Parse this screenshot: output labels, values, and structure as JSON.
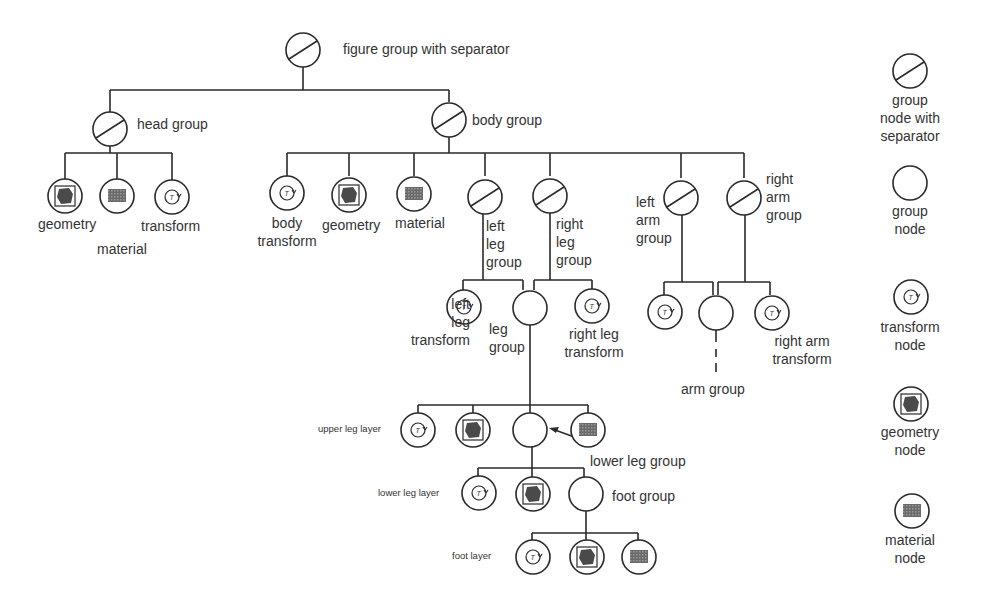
{
  "title": "figure group with separator",
  "nodes": {
    "figure": "figure group with separator",
    "head_group": "head group",
    "head_geometry": "geometry",
    "head_material": "material",
    "head_transform": "transform",
    "body_group": "body group",
    "body_transform": "body\ntransform",
    "body_geometry": "geometry",
    "body_material": "material",
    "left_leg_group": "left\nleg\ngroup",
    "right_leg_group": "right\nleg\ngroup",
    "left_arm_group": "left\narm\ngroup",
    "right_arm_group": "right\narm\ngroup",
    "left_leg_transform": "left\nleg\ntransform",
    "leg_group": "leg\ngroup",
    "right_leg_transform": "right leg\ntransform",
    "arm_group": "arm group",
    "right_arm_transform": "right arm\ntransform",
    "upper_leg_layer": "upper leg layer",
    "lower_leg_group": "lower leg group",
    "lower_leg_layer": "lower leg layer",
    "foot_group": "foot group",
    "foot_layer": "foot layer"
  },
  "legend": [
    {
      "icon": "group-separator-icon",
      "label": "group\nnode with\nseparator"
    },
    {
      "icon": "group-icon",
      "label": "group\nnode"
    },
    {
      "icon": "transform-icon",
      "label": "transform\nnode"
    },
    {
      "icon": "geometry-icon",
      "label": "geometry\nnode"
    },
    {
      "icon": "material-icon",
      "label": "material\nnode"
    }
  ],
  "colors": {
    "line": "#2a2a2a",
    "text": "#333333",
    "fill_dark": "#555555"
  }
}
